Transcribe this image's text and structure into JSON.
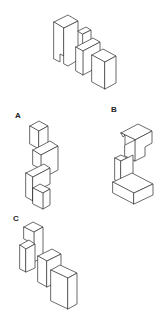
{
  "puzzle": {
    "reference_figure": {
      "description": "isometric block assembly (reference)"
    },
    "options": [
      {
        "label": "A",
        "description": "isometric block assembly option A"
      },
      {
        "label": "B",
        "description": "isometric block assembly option B"
      },
      {
        "label": "C",
        "description": "isometric block assembly option C"
      }
    ],
    "colors": {
      "line": "#3a3a3a",
      "background": "#ffffff",
      "label": "#222222"
    }
  }
}
